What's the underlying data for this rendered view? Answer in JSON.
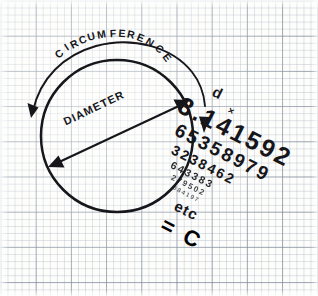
{
  "page": {
    "medium": "hand-drawn pen sketch on blue graph paper",
    "ink_color": "#16161a",
    "paper_color": "#fdfdfb",
    "grid_minor_color": "#96a0af",
    "grid_major_color": "#7884 96"
  },
  "diagram": {
    "title_concept": "circle circumference equals diameter times pi",
    "circle": {
      "center_x": 117,
      "center_y": 136,
      "radius": 76
    },
    "labels": {
      "circumference": "CIRCUMFERENCE",
      "diameter": "DIAMETER"
    },
    "arrows": {
      "circumference_arc": "double-headed arc outside circle spanning the top",
      "diameter_line": "double-headed straight arrow across the circle"
    }
  },
  "equation": {
    "variable": "d",
    "operator": "×",
    "pi_rows": [
      "3.141592",
      "65358979",
      "3238462",
      "643383",
      "279502",
      "884197"
    ],
    "continuation": "etc",
    "equals": "=",
    "result": "C"
  }
}
